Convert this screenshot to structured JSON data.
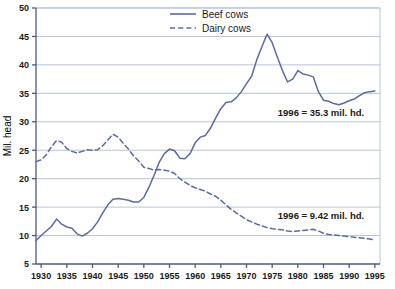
{
  "chart_data": {
    "type": "line",
    "title": "",
    "xlabel": "",
    "ylabel": "Mil. head",
    "xlim": [
      1929,
      1996
    ],
    "ylim": [
      5,
      50
    ],
    "grid": true,
    "legend_position": "top-center",
    "xticks": [
      1930,
      1935,
      1940,
      1945,
      1950,
      1955,
      1960,
      1965,
      1970,
      1975,
      1980,
      1985,
      1990,
      1995
    ],
    "yticks": [
      5,
      10,
      15,
      20,
      25,
      30,
      35,
      40,
      45,
      50
    ],
    "x": [
      1929,
      1930,
      1931,
      1932,
      1933,
      1934,
      1935,
      1936,
      1937,
      1938,
      1939,
      1940,
      1941,
      1942,
      1943,
      1944,
      1945,
      1946,
      1947,
      1948,
      1949,
      1950,
      1951,
      1952,
      1953,
      1954,
      1955,
      1956,
      1957,
      1958,
      1959,
      1960,
      1961,
      1962,
      1963,
      1964,
      1965,
      1966,
      1967,
      1968,
      1969,
      1970,
      1971,
      1972,
      1973,
      1974,
      1975,
      1976,
      1977,
      1978,
      1979,
      1980,
      1981,
      1982,
      1983,
      1984,
      1985,
      1986,
      1987,
      1988,
      1989,
      1990,
      1991,
      1992,
      1993,
      1994,
      1995
    ],
    "series": [
      {
        "name": "Beef cows",
        "style": "solid",
        "color": "#5b6b9e",
        "values": [
          9.1,
          10.0,
          10.8,
          11.6,
          12.9,
          12.0,
          11.5,
          11.3,
          10.3,
          9.9,
          10.4,
          11.2,
          12.4,
          14.0,
          15.4,
          16.4,
          16.5,
          16.4,
          16.2,
          15.9,
          15.9,
          16.7,
          18.5,
          20.6,
          22.9,
          24.4,
          25.2,
          24.9,
          23.6,
          23.5,
          24.4,
          26.3,
          27.3,
          27.6,
          28.9,
          30.7,
          32.3,
          33.4,
          33.5,
          34.2,
          35.3,
          36.7,
          38.0,
          40.9,
          43.2,
          45.4,
          43.9,
          41.4,
          39.0,
          37.0,
          37.5,
          39.0,
          38.4,
          38.2,
          37.9,
          35.3,
          33.8,
          33.6,
          33.2,
          33.0,
          33.3,
          33.7,
          34.0,
          34.6,
          35.1,
          35.3,
          35.4
        ]
      },
      {
        "name": "Dairy cows",
        "style": "dashed",
        "color": "#5b6b9e",
        "values": [
          23.0,
          23.3,
          24.2,
          25.6,
          26.7,
          26.4,
          25.3,
          24.8,
          24.5,
          24.8,
          25.1,
          25.0,
          25.1,
          25.8,
          26.8,
          27.8,
          27.3,
          26.2,
          25.2,
          24.0,
          23.1,
          22.0,
          21.8,
          21.5,
          21.6,
          21.5,
          21.3,
          20.9,
          20.0,
          19.4,
          18.8,
          18.4,
          18.1,
          17.8,
          17.3,
          16.9,
          16.2,
          15.4,
          14.6,
          14.0,
          13.4,
          12.8,
          12.4,
          12.0,
          11.7,
          11.4,
          11.2,
          11.1,
          11.0,
          10.8,
          10.7,
          10.8,
          10.9,
          11.0,
          11.1,
          10.8,
          10.4,
          10.2,
          10.1,
          10.0,
          9.9,
          9.8,
          9.7,
          9.6,
          9.5,
          9.4,
          9.2
        ]
      }
    ],
    "annotations": [
      {
        "text": "1996 = 35.3 mil. hd.",
        "series": "Beef cows",
        "x": 1984.5,
        "y": 31.0
      },
      {
        "text": "1996 = 9.42 mil. hd.",
        "series": "Dairy cows",
        "x": 1984.5,
        "y": 12.9
      }
    ]
  },
  "axes": {
    "y_axis_title": "Mil. head"
  },
  "legend": {
    "items": [
      {
        "label": "Beef cows",
        "style": "solid"
      },
      {
        "label": "Dairy cows",
        "style": "dashed"
      }
    ]
  },
  "colors": {
    "line": "#5b6b9e",
    "grid": "#b9c3d6",
    "axis": "#4a5a80",
    "background": "#ffffff"
  }
}
